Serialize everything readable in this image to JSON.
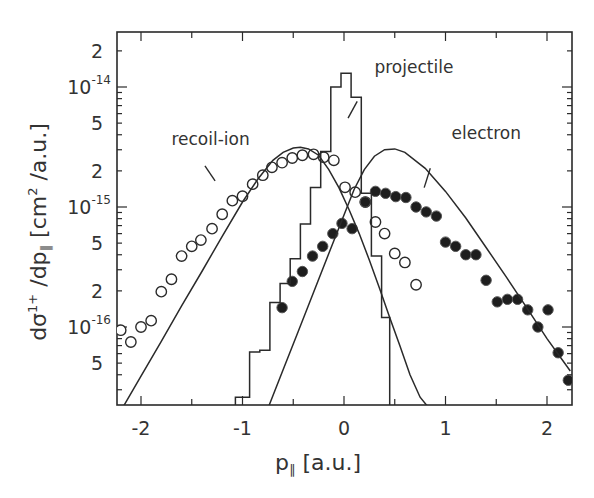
{
  "chart_data": {
    "type": "scatter",
    "title": "",
    "xlabel": "p_∥ [a.u.]",
    "ylabel": "dσ¹⁺/dp_∥ [cm²/a.u.]",
    "xlim": [
      -2.23,
      2.23
    ],
    "ylim": [
      2.2e-17,
      2.8e-14
    ],
    "yscale": "log",
    "grid": false,
    "legend_position": "inline annotations",
    "x_ticks": [
      -2,
      -1,
      0,
      1,
      2
    ],
    "x_tick_labels": [
      "-2",
      "-1",
      "0",
      "1",
      "2"
    ],
    "y_major_ticks": [
      1e-16,
      1e-15,
      1e-14
    ],
    "y_major_labels": [
      {
        "base": "10",
        "exp": "-16"
      },
      {
        "base": "10",
        "exp": "-15"
      },
      {
        "base": "10",
        "exp": "-14"
      }
    ],
    "y_minor_labels": [
      {
        "value": 5e-17,
        "label": "5"
      },
      {
        "value": 2e-16,
        "label": "2"
      },
      {
        "value": 5e-16,
        "label": "5"
      },
      {
        "value": 2e-15,
        "label": "2"
      },
      {
        "value": 5e-15,
        "label": "5"
      },
      {
        "value": 2e-14,
        "label": "2"
      }
    ],
    "annotations": [
      {
        "text": "recoil-ion",
        "x": -1.7,
        "y": 3.3e-15,
        "leader": [
          [
            -1.37,
            2.2e-15
          ],
          [
            -1.27,
            1.65e-15
          ]
        ]
      },
      {
        "text": "projectile",
        "x": 0.3,
        "y": 1.3e-14,
        "leader": [
          [
            0.13,
            7.6e-15
          ],
          [
            0.04,
            5.5e-15
          ]
        ]
      },
      {
        "text": "electron",
        "x": 1.06,
        "y": 3.7e-15,
        "leader": [
          [
            0.85,
            2.1e-15
          ],
          [
            0.79,
            1.45e-15
          ]
        ]
      }
    ],
    "series": [
      {
        "name": "recoil-ion",
        "marker": "open-circle",
        "x": [
          -2.2,
          -2.1,
          -2.0,
          -1.9,
          -1.8,
          -1.7,
          -1.6,
          -1.5,
          -1.41,
          -1.3,
          -1.2,
          -1.1,
          -1.0,
          -0.9,
          -0.8,
          -0.71,
          -0.61,
          -0.51,
          -0.41,
          -0.3,
          -0.2,
          -0.1,
          0.01,
          0.11,
          0.21,
          0.31,
          0.4,
          0.5,
          0.6,
          0.71
        ],
        "y": [
          9.4e-17,
          7.5e-17,
          1e-16,
          1.13e-16,
          1.97e-16,
          2.5e-16,
          3.9e-16,
          4.7e-16,
          5.3e-16,
          6.6e-16,
          8.7e-16,
          1.13e-15,
          1.23e-15,
          1.55e-15,
          1.84e-15,
          2.14e-15,
          2.34e-15,
          2.56e-15,
          2.7e-15,
          2.75e-15,
          2.6e-15,
          2.45e-15,
          1.46e-15,
          1.33e-15,
          1.1e-15,
          7.5e-16,
          6e-16,
          4.1e-16,
          3.45e-16,
          2.25e-16
        ]
      },
      {
        "name": "electron",
        "marker": "filled-circle",
        "x": [
          -0.61,
          -0.51,
          -0.41,
          -0.31,
          -0.21,
          -0.11,
          -0.02,
          0.08,
          0.21,
          0.31,
          0.41,
          0.51,
          0.61,
          0.71,
          0.81,
          0.91,
          1.0,
          1.1,
          1.2,
          1.3,
          1.4,
          1.51,
          1.61,
          1.71,
          1.81,
          1.91,
          2.01,
          2.11,
          2.21
        ],
        "y": [
          1.45e-16,
          2.4e-16,
          2.9e-16,
          3.9e-16,
          4.7e-16,
          6e-16,
          7.3e-16,
          6.6e-16,
          1.1e-15,
          1.35e-15,
          1.3e-15,
          1.22e-15,
          1.2e-15,
          1e-15,
          9.1e-16,
          8.4e-16,
          5.1e-16,
          4.7e-16,
          4e-16,
          4e-16,
          2.45e-16,
          1.62e-16,
          1.7e-16,
          1.7e-16,
          1.39e-16,
          1e-16,
          1.39e-16,
          6.1e-17,
          3.6e-17
        ]
      },
      {
        "name": "projectile",
        "type": "step-histogram",
        "edges": [
          -1.07,
          -0.93,
          -0.83,
          -0.73,
          -0.63,
          -0.53,
          -0.43,
          -0.33,
          -0.23,
          -0.13,
          -0.03,
          0.07,
          0.17,
          0.27,
          0.37,
          0.45
        ],
        "values": [
          2.6e-17,
          6.2e-17,
          6.4e-17,
          1.6e-16,
          2.3e-16,
          3.7e-16,
          7.2e-16,
          1.45e-15,
          2.9e-15,
          1e-14,
          1.3e-14,
          8.2e-15,
          1.3e-15,
          3.9e-16,
          1.2e-16
        ]
      },
      {
        "name": "recoil-ion-theory",
        "type": "line",
        "x": [
          -2.17,
          -2.0,
          -1.8,
          -1.6,
          -1.4,
          -1.2,
          -1.0,
          -0.85,
          -0.7,
          -0.6,
          -0.5,
          -0.43,
          -0.35,
          -0.25,
          -0.15,
          -0.05,
          0.05,
          0.15,
          0.25,
          0.35,
          0.45,
          0.55,
          0.65,
          0.75,
          0.82
        ],
        "y": [
          2.2e-17,
          3.9e-17,
          7.6e-17,
          1.5e-16,
          2.9e-16,
          5.7e-16,
          1.1e-15,
          1.7e-15,
          2.45e-15,
          2.85e-15,
          3.1e-15,
          3.15e-15,
          3.05e-15,
          2.7e-15,
          2.05e-15,
          1.45e-15,
          9.5e-16,
          6e-16,
          3.6e-16,
          2.1e-16,
          1.2e-16,
          7e-17,
          4e-17,
          2.6e-17,
          2.2e-17
        ]
      },
      {
        "name": "electron-theory",
        "type": "line",
        "x": [
          -0.74,
          -0.6,
          -0.45,
          -0.3,
          -0.15,
          0.0,
          0.1,
          0.2,
          0.3,
          0.4,
          0.5,
          0.6,
          0.8,
          1.0,
          1.2,
          1.4,
          1.6,
          1.8,
          2.0,
          2.23
        ],
        "y": [
          2.2e-17,
          4.4e-17,
          9.2e-17,
          1.95e-16,
          4.1e-16,
          8.6e-16,
          1.4e-15,
          2.05e-15,
          2.65e-15,
          3e-15,
          3.05e-15,
          2.85e-15,
          2.1e-15,
          1.35e-15,
          8.1e-16,
          4.6e-16,
          2.6e-16,
          1.45e-16,
          8e-17,
          4.3e-17
        ]
      }
    ]
  },
  "labels": {
    "xlabel_main": "p",
    "xlabel_sub": "∥",
    "xlabel_units": " [a.u.]",
    "ylabel_text": "dσ",
    "ylabel_sup": "1+",
    "ylabel_mid": " /dp",
    "ylabel_sub": "∥",
    "ylabel_units": "  [cm",
    "ylabel_units_sup": "2",
    "ylabel_units_end": " /a.u.]"
  },
  "colors": {
    "ink": "#2a2a2a",
    "background": "#ffffff"
  }
}
